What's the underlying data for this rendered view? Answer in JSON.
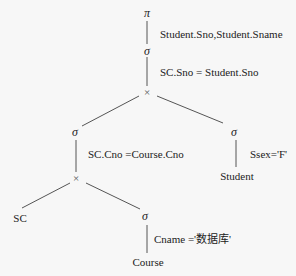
{
  "diagram": {
    "nodes": {
      "project": {
        "symbol": "π",
        "condition": "Student.Sno,Student.Sname"
      },
      "select_join": {
        "symbol": "σ",
        "condition": "SC.Sno = Student.Sno"
      },
      "cross_top": {
        "symbol": "×"
      },
      "select_left": {
        "symbol": "σ",
        "condition": "SC.Cno =Course.Cno"
      },
      "select_right": {
        "symbol": "σ",
        "condition": "Ssex='F'"
      },
      "student": {
        "label": "Student"
      },
      "cross_bottom": {
        "symbol": "×"
      },
      "sc": {
        "label": "SC"
      },
      "select_course": {
        "symbol": "σ",
        "condition": "Cname ='数据库'"
      },
      "course": {
        "label": "Course"
      }
    },
    "edges": [
      [
        "project",
        "select_join"
      ],
      [
        "select_join",
        "cross_top"
      ],
      [
        "cross_top",
        "select_left"
      ],
      [
        "cross_top",
        "select_right"
      ],
      [
        "select_right",
        "student"
      ],
      [
        "select_left",
        "cross_bottom"
      ],
      [
        "cross_bottom",
        "sc"
      ],
      [
        "cross_bottom",
        "select_course"
      ],
      [
        "select_course",
        "course"
      ]
    ]
  }
}
